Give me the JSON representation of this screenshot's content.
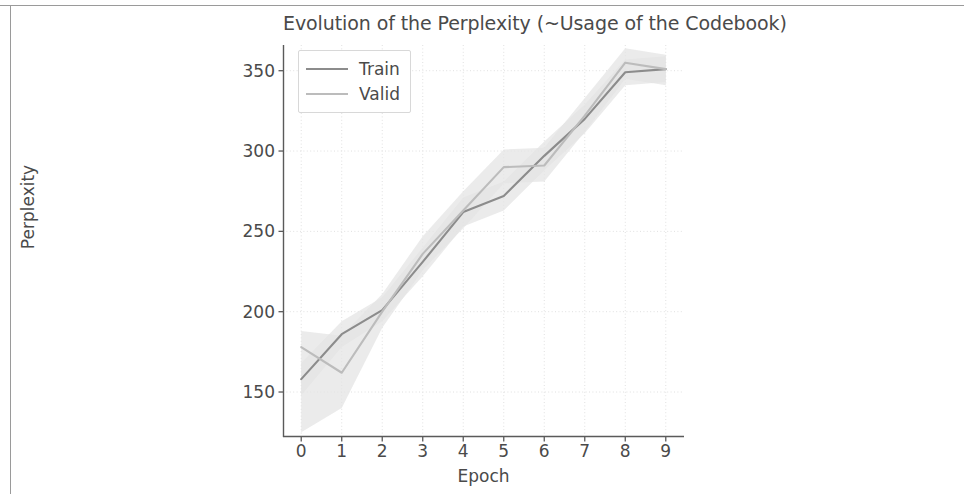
{
  "chart_data": {
    "type": "line",
    "title": "Evolution of the Perplexity (~Usage of the Codebook)",
    "xlabel": "Epoch",
    "ylabel": "Perplexity",
    "x": [
      0,
      1,
      2,
      3,
      4,
      5,
      6,
      7,
      8,
      9
    ],
    "xticks": [
      "0",
      "1",
      "2",
      "3",
      "4",
      "5",
      "6",
      "7",
      "8",
      "9"
    ],
    "yticks": [
      "150",
      "200",
      "250",
      "300",
      "350"
    ],
    "ytick_values": [
      150,
      200,
      250,
      300,
      350
    ],
    "xlim": [
      -0.45,
      9.45
    ],
    "ylim": [
      122,
      366
    ],
    "grid": true,
    "legend_position": "upper left",
    "series": [
      {
        "name": "Train",
        "color": "#8c8c8c",
        "values": [
          158,
          186,
          201,
          231,
          262,
          272,
          297,
          320,
          349,
          351
        ],
        "band_lower": [
          148,
          178,
          194,
          222,
          253,
          263,
          288,
          311,
          341,
          343
        ],
        "band_upper": [
          168,
          194,
          209,
          240,
          271,
          281,
          306,
          329,
          357,
          359
        ]
      },
      {
        "name": "Valid",
        "color": "#bcbcbc",
        "values": [
          178,
          162,
          200,
          236,
          263,
          290,
          291,
          322,
          355,
          351
        ],
        "band_lower": [
          125,
          140,
          190,
          226,
          252,
          280,
          281,
          312,
          345,
          341
        ],
        "band_upper": [
          188,
          185,
          211,
          247,
          275,
          301,
          302,
          333,
          364,
          360
        ]
      }
    ]
  },
  "legend": {
    "items": [
      {
        "label": "Train"
      },
      {
        "label": "Valid"
      }
    ]
  },
  "colors": {
    "train_line": "#8c8c8c",
    "valid_line": "#bcbcbc",
    "band": "#e3e3e3",
    "grid": "#e0e0e0",
    "axis": "#5a5a5a",
    "text": "#4a4a4a",
    "page_frame": "#9a9a9a"
  }
}
